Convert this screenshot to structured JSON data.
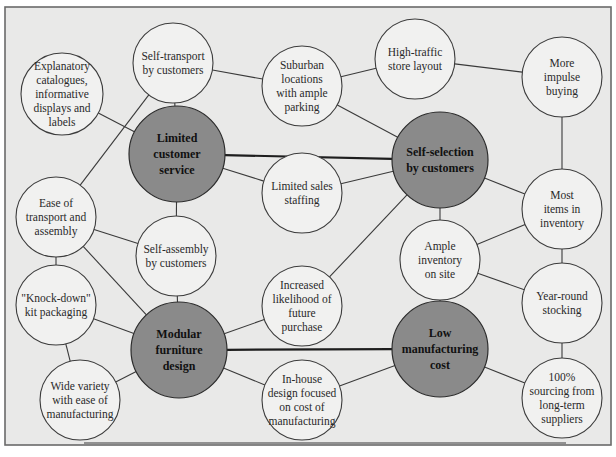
{
  "diagram": {
    "type": "activity-system map",
    "colors": {
      "background": "#e9e9e8",
      "frame_border": "#6a6a6a",
      "node_fill": "#f1f1f0",
      "core_node_fill": "#8a8a8a",
      "link": "#3a3a3a"
    },
    "nodes": [
      {
        "id": "explanatory",
        "lines": [
          "Explanatory",
          "catalogues,",
          "informative",
          "displays and",
          "labels"
        ],
        "core": false,
        "cx": 62,
        "cy": 94,
        "r": 41
      },
      {
        "id": "self_transport",
        "lines": [
          "Self-transport",
          "by customers"
        ],
        "core": false,
        "cx": 173,
        "cy": 63,
        "r": 40
      },
      {
        "id": "suburban",
        "lines": [
          "Suburban",
          "locations",
          "with ample",
          "parking"
        ],
        "core": false,
        "cx": 302,
        "cy": 86,
        "r": 40
      },
      {
        "id": "high_traffic",
        "lines": [
          "High-traffic",
          "store layout"
        ],
        "core": false,
        "cx": 415,
        "cy": 59,
        "r": 40
      },
      {
        "id": "impulse",
        "lines": [
          "More",
          "impulse",
          "buying"
        ],
        "core": false,
        "cx": 562,
        "cy": 77,
        "r": 40
      },
      {
        "id": "limited_service",
        "lines": [
          "Limited",
          "customer",
          "service"
        ],
        "core": true,
        "cx": 177,
        "cy": 154,
        "r": 48
      },
      {
        "id": "self_selection",
        "lines": [
          "Self-selection",
          "by customers"
        ],
        "core": true,
        "cx": 440,
        "cy": 160,
        "r": 48
      },
      {
        "id": "limited_staffing",
        "lines": [
          "Limited sales",
          "staffing"
        ],
        "core": false,
        "cx": 302,
        "cy": 193,
        "r": 40
      },
      {
        "id": "ease_transport",
        "lines": [
          "Ease of",
          "transport and",
          "assembly"
        ],
        "core": false,
        "cx": 56,
        "cy": 217,
        "r": 40
      },
      {
        "id": "self_assembly",
        "lines": [
          "Self-assembly",
          "by customers"
        ],
        "core": false,
        "cx": 176,
        "cy": 256,
        "r": 40
      },
      {
        "id": "most_items",
        "lines": [
          "Most",
          "items in",
          "inventory"
        ],
        "core": false,
        "cx": 562,
        "cy": 209,
        "r": 40
      },
      {
        "id": "ample_inventory",
        "lines": [
          "Ample",
          "inventory",
          "on site"
        ],
        "core": false,
        "cx": 440,
        "cy": 260,
        "r": 40
      },
      {
        "id": "knock_down",
        "lines": [
          "\"Knock-down\"",
          "kit packaging"
        ],
        "core": false,
        "cx": 56,
        "cy": 305,
        "r": 40
      },
      {
        "id": "increased_likelihood",
        "lines": [
          "Increased",
          "likelihood of",
          "future",
          "purchase"
        ],
        "core": false,
        "cx": 302,
        "cy": 306,
        "r": 40
      },
      {
        "id": "year_round",
        "lines": [
          "Year-round",
          "stocking"
        ],
        "core": false,
        "cx": 562,
        "cy": 303,
        "r": 40
      },
      {
        "id": "modular",
        "lines": [
          "Modular",
          "furniture",
          "design"
        ],
        "core": true,
        "cx": 179,
        "cy": 350,
        "r": 48
      },
      {
        "id": "low_cost",
        "lines": [
          "Low",
          "manufacturing",
          "cost"
        ],
        "core": true,
        "cx": 440,
        "cy": 349,
        "r": 48
      },
      {
        "id": "wide_variety",
        "lines": [
          "Wide variety",
          "with ease of",
          "manufacturing"
        ],
        "core": false,
        "cx": 80,
        "cy": 400,
        "r": 40
      },
      {
        "id": "in_house",
        "lines": [
          "In-house",
          "design focused",
          "on cost of",
          "manufacturing"
        ],
        "core": false,
        "cx": 302,
        "cy": 400,
        "r": 40
      },
      {
        "id": "sourcing",
        "lines": [
          "100%",
          "sourcing from",
          "long-term",
          "suppliers"
        ],
        "core": false,
        "cx": 562,
        "cy": 398,
        "r": 40
      }
    ],
    "links": [
      {
        "from": "limited_service",
        "to": "self_selection",
        "strong": true
      },
      {
        "from": "modular",
        "to": "low_cost",
        "strong": true
      },
      {
        "from": "explanatory",
        "to": "limited_service"
      },
      {
        "from": "self_transport",
        "to": "limited_service"
      },
      {
        "from": "self_transport",
        "to": "suburban"
      },
      {
        "from": "self_transport",
        "to": "ease_transport"
      },
      {
        "from": "suburban",
        "to": "high_traffic"
      },
      {
        "from": "suburban",
        "to": "self_selection"
      },
      {
        "from": "high_traffic",
        "to": "impulse"
      },
      {
        "from": "impulse",
        "to": "most_items"
      },
      {
        "from": "limited_service",
        "to": "limited_staffing"
      },
      {
        "from": "limited_service",
        "to": "self_assembly"
      },
      {
        "from": "limited_staffing",
        "to": "self_selection"
      },
      {
        "from": "self_selection",
        "to": "most_items"
      },
      {
        "from": "self_selection",
        "to": "ample_inventory"
      },
      {
        "from": "self_selection",
        "to": "increased_likelihood"
      },
      {
        "from": "ease_transport",
        "to": "self_assembly"
      },
      {
        "from": "ease_transport",
        "to": "knock_down"
      },
      {
        "from": "ease_transport",
        "to": "modular"
      },
      {
        "from": "self_assembly",
        "to": "modular"
      },
      {
        "from": "most_items",
        "to": "ample_inventory"
      },
      {
        "from": "most_items",
        "to": "year_round"
      },
      {
        "from": "ample_inventory",
        "to": "year_round"
      },
      {
        "from": "ample_inventory",
        "to": "low_cost"
      },
      {
        "from": "knock_down",
        "to": "modular"
      },
      {
        "from": "knock_down",
        "to": "wide_variety"
      },
      {
        "from": "increased_likelihood",
        "to": "modular"
      },
      {
        "from": "year_round",
        "to": "sourcing"
      },
      {
        "from": "modular",
        "to": "wide_variety"
      },
      {
        "from": "modular",
        "to": "in_house"
      },
      {
        "from": "in_house",
        "to": "low_cost"
      },
      {
        "from": "low_cost",
        "to": "sourcing"
      }
    ],
    "bottom_link": {
      "from": "wide_variety",
      "to": "sourcing",
      "y": 443,
      "x1": 84,
      "x2": 566
    }
  }
}
